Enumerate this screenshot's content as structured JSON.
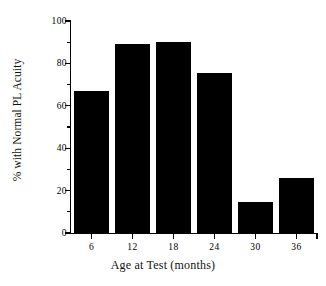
{
  "chart_data": {
    "type": "bar",
    "title": "",
    "xlabel": "Age at Test (months)",
    "ylabel": "% with Normal PL Acuity",
    "categories": [
      "6",
      "12",
      "18",
      "24",
      "30",
      "36"
    ],
    "values": [
      67,
      89,
      90,
      75.5,
      14.5,
      26
    ],
    "ylim": [
      0,
      100
    ],
    "yticks": [
      0,
      20,
      40,
      60,
      80,
      100
    ],
    "ytick_labels": [
      "0",
      "20",
      "40",
      "60",
      "80",
      "100"
    ],
    "yminor_ticks": [
      10,
      30,
      50,
      70,
      90
    ],
    "xtick_labels": [
      "6",
      "12",
      "18",
      "24",
      "30",
      "36"
    ],
    "grid": false,
    "legend": null,
    "bar_color": "#000000",
    "background_color": "#ffffff",
    "axis_color": "#000000"
  },
  "axes": {
    "y_title": "% with Normal PL Acuity",
    "x_title": "Age at Test (months)"
  }
}
